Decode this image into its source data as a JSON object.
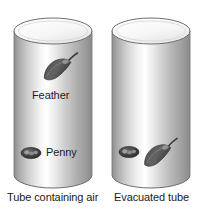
{
  "figure": {
    "background_color": "#ffffff",
    "tubes": [
      {
        "id": "air-tube",
        "caption": "Tube containing air",
        "x": 14,
        "y": 18,
        "width": 78,
        "height": 170,
        "ellipse_ry": 13,
        "objects": [
          {
            "name": "feather",
            "label": "Feather",
            "position": "upper-middle",
            "cx": 58,
            "cy": 68
          },
          {
            "name": "penny",
            "label": "Penny",
            "position": "lower",
            "cx": 31,
            "cy": 153
          }
        ]
      },
      {
        "id": "evacuated-tube",
        "caption": "Evacuated tube",
        "x": 112,
        "y": 18,
        "width": 78,
        "height": 170,
        "ellipse_ry": 13,
        "objects": [
          {
            "name": "feather",
            "label": "",
            "position": "bottom",
            "cx": 158,
            "cy": 154
          },
          {
            "name": "penny",
            "label": "",
            "position": "bottom",
            "cx": 129,
            "cy": 152
          }
        ]
      }
    ],
    "colors": {
      "tube_light": "#fdfdfd",
      "tube_mid": "#c9c9c9",
      "tube_dark": "#8e8e8e",
      "tube_edge": "#6e6e6e",
      "top_face": "#f4f4f4",
      "object_dark": "#3d3d3d",
      "object_mid": "#5c5c5c",
      "text": "#1a1a1a"
    }
  }
}
